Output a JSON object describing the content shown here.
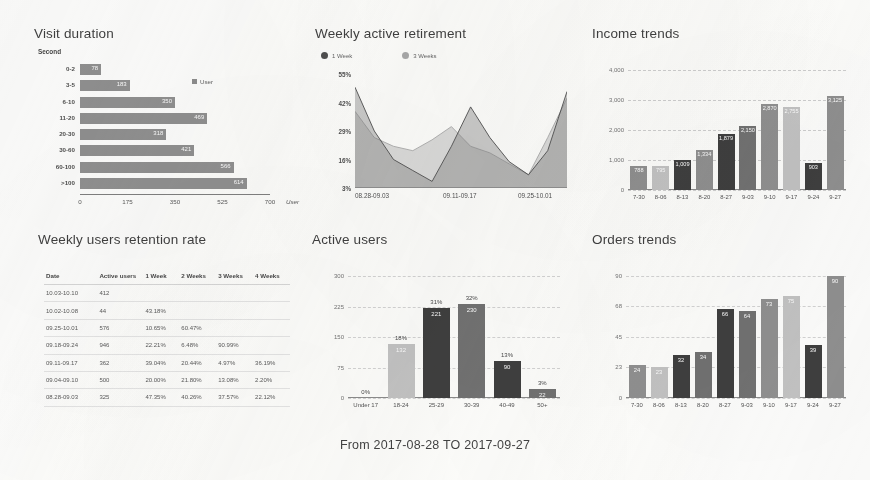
{
  "footer": {
    "date_range": "From 2017-08-28 TO 2017-09-27"
  },
  "panels": {
    "visit_duration": {
      "title": "Visit duration",
      "unit_top": "Second",
      "unit_right": "User",
      "legend": "User",
      "legend_icon": "square-swatch-icon"
    },
    "retirement": {
      "title": "Weekly active retirement",
      "legend": [
        "1 Week",
        "3 Weeks"
      ],
      "legend_icon": "circle-dot-icon"
    },
    "income": {
      "title": "Income trends"
    },
    "retention": {
      "title": "Weekly users retention rate"
    },
    "active_users": {
      "title": "Active users"
    },
    "orders": {
      "title": "Orders trends"
    }
  },
  "colors": {
    "bar_grey": "#8e8e8e",
    "bar_dark": "#3a3a3a",
    "bar_light": "#c3c3c3",
    "bar_mid": "#6f6f6f",
    "series_1week": "#4a4a4a",
    "series_3weeks": "#a8a8a8",
    "text": "#3c3c3c",
    "grid": "#d4d4d4"
  },
  "chart_data": [
    {
      "id": "visit-duration",
      "type": "bar",
      "orientation": "horizontal",
      "title": "Visit duration",
      "xlabel": "User",
      "ylabel": "Second",
      "xlim": [
        0,
        700
      ],
      "xticks": [
        0,
        175,
        350,
        525,
        700
      ],
      "grid": false,
      "legend": [
        "User"
      ],
      "legend_position": "inside-top-right",
      "categories": [
        "0-2",
        "3-5",
        "6-10",
        "11-20",
        "20-30",
        "30-60",
        "60-100",
        ">100"
      ],
      "values": [
        78,
        183,
        350,
        469,
        318,
        421,
        566,
        614
      ]
    },
    {
      "id": "weekly-active-retirement",
      "type": "area",
      "title": "Weekly active retirement",
      "xlabel": "",
      "ylabel": "",
      "ylim": [
        3,
        55
      ],
      "yticks": [
        "3%",
        "16%",
        "29%",
        "42%",
        "55%"
      ],
      "xticks": [
        "08.28-09.03",
        "09.11-09.17",
        "09.25-10.01"
      ],
      "grid": false,
      "legend_position": "top-left",
      "series": [
        {
          "name": "1 Week",
          "values": [
            49,
            29,
            16,
            11,
            6,
            22,
            40,
            26,
            15,
            9,
            20,
            47
          ]
        },
        {
          "name": "3 Weeks",
          "values": [
            38,
            26,
            22,
            20,
            25,
            31,
            22,
            19,
            14,
            9,
            26,
            44
          ]
        }
      ]
    },
    {
      "id": "income-trends",
      "type": "bar",
      "title": "Income trends",
      "xlabel": "",
      "ylabel": "",
      "ylim": [
        0,
        4000
      ],
      "yticks": [
        0,
        1000,
        2000,
        3000,
        4000
      ],
      "grid": true,
      "categories": [
        "7-30",
        "8-06",
        "8-13",
        "8-20",
        "8-27",
        "9-03",
        "9-10",
        "9-17",
        "9-24",
        "9-27"
      ],
      "values": [
        788,
        795,
        1009,
        1334,
        1879,
        2150,
        2870,
        2755,
        903,
        3125
      ],
      "value_labels": [
        "788",
        "795",
        "1,009",
        "1,334",
        "1,879",
        "2,150",
        "2,870",
        "2,755",
        "903",
        "3,125"
      ]
    },
    {
      "id": "weekly-users-retention-rate",
      "type": "table",
      "title": "Weekly users retention rate",
      "columns": [
        "Date",
        "Active users",
        "1 Week",
        "2 Weeks",
        "3 Weeks",
        "4 Weeks"
      ],
      "rows": [
        [
          "10.03-10.10",
          "412",
          "",
          "",
          "",
          ""
        ],
        [
          "10.02-10.08",
          "44",
          "43.18%",
          "",
          "",
          ""
        ],
        [
          "09.25-10.01",
          "576",
          "10.65%",
          "60.47%",
          "",
          ""
        ],
        [
          "09.18-09.24",
          "946",
          "22.21%",
          "6.48%",
          "90.99%",
          ""
        ],
        [
          "09.11-09.17",
          "362",
          "39.04%",
          "20.44%",
          "4.97%",
          "36.19%"
        ],
        [
          "09.04-09.10",
          "500",
          "20.00%",
          "21.80%",
          "13.08%",
          "2.20%"
        ],
        [
          "08.28-09.03",
          "325",
          "47.35%",
          "40.26%",
          "37.57%",
          "22.12%"
        ]
      ]
    },
    {
      "id": "active-users",
      "type": "bar",
      "title": "Active users",
      "xlabel": "",
      "ylabel": "",
      "ylim": [
        0,
        300
      ],
      "yticks": [
        0,
        75,
        150,
        225,
        300
      ],
      "grid": true,
      "categories": [
        "Under 17",
        "18-24",
        "25-29",
        "30-39",
        "40-49",
        "50+"
      ],
      "values": [
        0,
        132,
        221,
        230,
        90,
        22
      ],
      "percent_labels": [
        "0%",
        "18%",
        "31%",
        "32%",
        "13%",
        "3%"
      ],
      "value_labels": [
        "",
        "132",
        "221",
        "230",
        "90",
        "22"
      ]
    },
    {
      "id": "orders-trends",
      "type": "bar",
      "title": "Orders trends",
      "xlabel": "",
      "ylabel": "",
      "ylim": [
        0,
        90
      ],
      "yticks": [
        0,
        23,
        45,
        68,
        90
      ],
      "grid": true,
      "categories": [
        "7-30",
        "8-06",
        "8-13",
        "8-20",
        "8-27",
        "9-03",
        "9-10",
        "9-17",
        "9-24",
        "9-27"
      ],
      "values": [
        24,
        23,
        32,
        34,
        66,
        64,
        73,
        75,
        39,
        90
      ]
    }
  ]
}
